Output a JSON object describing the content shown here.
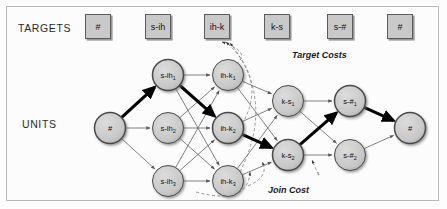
{
  "figure": {
    "row_labels": {
      "targets": "TARGETS",
      "units": "UNITS"
    },
    "annotations": {
      "target_costs": "Target Costs",
      "join_cost": "Join Cost"
    },
    "colors": {
      "node_fill": "#c8c8c8",
      "node_stroke": "#4a4a4a",
      "box_fill": "#c9c9c9",
      "box_stroke": "#5c5c5c",
      "best_path": "#000000",
      "edge": "#6b6b6b",
      "cost_edge": "#8a8a8a"
    }
  },
  "targets": [
    {
      "label": "#",
      "x": 98
    },
    {
      "label": "s-ih",
      "x": 158
    },
    {
      "label": "ih-k",
      "x": 217
    },
    {
      "label": "k-s",
      "x": 277
    },
    {
      "label": "s-#",
      "x": 340
    },
    {
      "label": "#",
      "x": 400
    }
  ],
  "units": {
    "columns": [
      {
        "name": "start",
        "base": "#",
        "nodes": [
          {
            "id": "start",
            "label": "#",
            "sub": "",
            "x": 110,
            "y": 128
          }
        ]
      },
      {
        "name": "s-ih",
        "base": "s-ih",
        "nodes": [
          {
            "id": "s-ih1",
            "label": "s-ih",
            "sub": "1",
            "x": 168,
            "y": 75
          },
          {
            "id": "s-ih2",
            "label": "s-ih",
            "sub": "2",
            "x": 168,
            "y": 128
          },
          {
            "id": "s-ih3",
            "label": "s-ih",
            "sub": "3",
            "x": 168,
            "y": 181
          }
        ]
      },
      {
        "name": "ih-k",
        "base": "ih-k",
        "nodes": [
          {
            "id": "ih-k1",
            "label": "ih-k",
            "sub": "1",
            "x": 228,
            "y": 75
          },
          {
            "id": "ih-k2",
            "label": "ih-k",
            "sub": "2",
            "x": 228,
            "y": 128
          },
          {
            "id": "ih-k3",
            "label": "ih-k",
            "sub": "3",
            "x": 228,
            "y": 181
          }
        ]
      },
      {
        "name": "k-s",
        "base": "k-s",
        "nodes": [
          {
            "id": "k-s1",
            "label": "k-s",
            "sub": "1",
            "x": 288,
            "y": 101
          },
          {
            "id": "k-s2",
            "label": "k-s",
            "sub": "2",
            "x": 288,
            "y": 155
          }
        ]
      },
      {
        "name": "s-#",
        "base": "s-#",
        "nodes": [
          {
            "id": "s-#1",
            "label": "s-#",
            "sub": "1",
            "x": 350,
            "y": 101
          },
          {
            "id": "s-#2",
            "label": "s-#",
            "sub": "2",
            "x": 350,
            "y": 155
          }
        ]
      },
      {
        "name": "end",
        "base": "#",
        "nodes": [
          {
            "id": "end",
            "label": "#",
            "sub": "",
            "x": 410,
            "y": 128
          }
        ]
      }
    ],
    "best_path": [
      "start",
      "s-ih1",
      "ih-k2",
      "k-s2",
      "s-#1",
      "end"
    ]
  }
}
